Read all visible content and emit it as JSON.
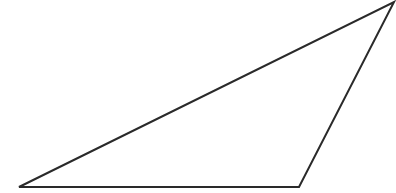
{
  "diagram": {
    "type": "triangle",
    "stroke_color": "#2a2a2a",
    "fill_color": "#ffffff",
    "stroke_width": 2,
    "vertices": [
      {
        "name": "bottom-left",
        "x": 19,
        "y": 187
      },
      {
        "name": "bottom-right",
        "x": 299,
        "y": 187
      },
      {
        "name": "top-right",
        "x": 394,
        "y": 2
      }
    ]
  }
}
